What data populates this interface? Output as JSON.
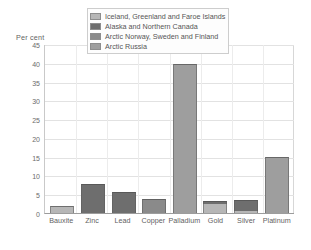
{
  "chart_data": {
    "type": "bar",
    "title": "",
    "subtitle": "",
    "xlabel": "",
    "ylabel": "Per cent",
    "ylim": [
      0,
      45
    ],
    "ytick_labels": [
      "45",
      "40",
      "35",
      "30",
      "25",
      "20",
      "15",
      "10",
      "5",
      "0"
    ],
    "ytick_values": [
      45,
      40,
      35,
      30,
      25,
      20,
      15,
      10,
      5,
      0
    ],
    "grid": true,
    "legend_position": "top-center",
    "categories": [
      "Bauxite",
      "Zinc",
      "Lead",
      "Copper",
      "Palladium",
      "Gold",
      "Silver",
      "Platinum"
    ],
    "series": [
      {
        "name": "Iceland, Greenland and Faroe Islands",
        "color": "#b6b6b6",
        "values": [
          2.0,
          0,
          0,
          0,
          0,
          2.4,
          0.6,
          0
        ]
      },
      {
        "name": "Alaska and Northern Canada",
        "color": "#6e6e6e",
        "values": [
          0,
          7.8,
          5.5,
          0,
          0,
          0.7,
          2.8,
          0
        ]
      },
      {
        "name": "Arctic Norway, Sweden and Finland",
        "color": "#8a8a8a",
        "values": [
          0,
          0,
          0,
          3.8,
          0,
          0,
          0,
          0
        ]
      },
      {
        "name": "Arctic Russia",
        "color": "#9e9e9e",
        "values": [
          0,
          0,
          0,
          0,
          39.7,
          0,
          0,
          15.0
        ]
      }
    ],
    "totals": [
      2.0,
      7.8,
      5.5,
      3.8,
      39.7,
      3.1,
      3.4,
      15.0
    ]
  },
  "legend": {
    "items": [
      {
        "label": "Iceland, Greenland and Faroe Islands",
        "color": "#b6b6b6"
      },
      {
        "label": "Alaska and Northern Canada",
        "color": "#6e6e6e"
      },
      {
        "label": "Arctic Norway, Sweden and Finland",
        "color": "#8a8a8a"
      },
      {
        "label": "Arctic Russia",
        "color": "#9e9e9e"
      }
    ]
  },
  "axis": {
    "y_title": "Per cent"
  }
}
